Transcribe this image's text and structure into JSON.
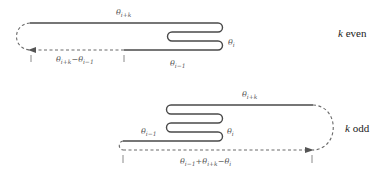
{
  "diagram": {
    "top": {
      "case_var": "k",
      "case_word": "even",
      "labels": {
        "top_line": {
          "sym": "θ",
          "sub": "i+k"
        },
        "fold_end": {
          "sym": "θ",
          "sub": "i"
        },
        "bottom_line": {
          "sym": "θ",
          "sub": "i−1"
        },
        "dashed_span": {
          "sym": "θ",
          "sub": "i+k",
          "op": "−",
          "sym2": "θ",
          "sub2": "i−1"
        }
      }
    },
    "bottom": {
      "case_var": "k",
      "case_word": "odd",
      "labels": {
        "top_line": {
          "sym": "θ",
          "sub": "i+k"
        },
        "fold_end": {
          "sym": "θ",
          "sub": "i"
        },
        "left_line": {
          "sym": "θ",
          "sub": "i−1"
        },
        "dashed_span": {
          "sym": "θ",
          "sub": "i−1",
          "op": "+",
          "sym2": "θ",
          "sub2": "i+k",
          "op2": "−",
          "sym3": "θ",
          "sub3": "i"
        }
      }
    },
    "colors": {
      "line": "#4a4a4a",
      "dashed": "#6a6a6a",
      "text": "#555555"
    }
  }
}
